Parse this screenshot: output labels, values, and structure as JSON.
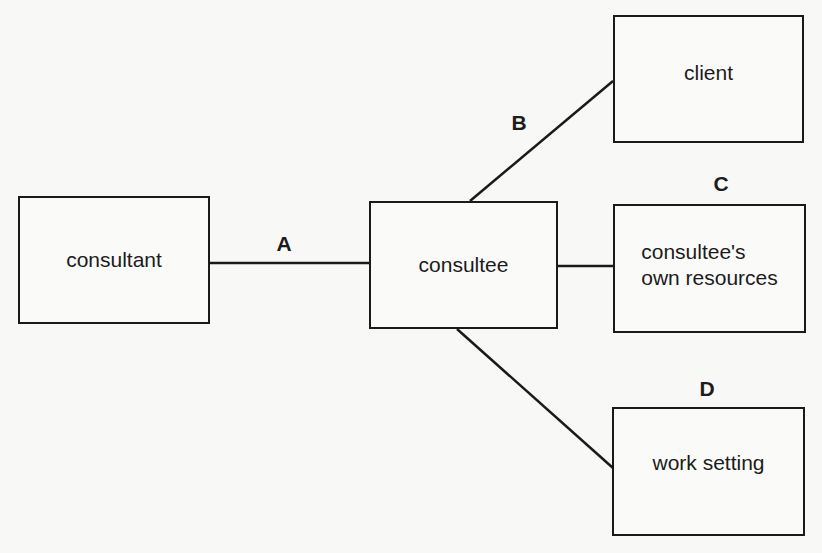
{
  "diagram": {
    "nodes": [
      {
        "id": "consultant",
        "label": "consultant"
      },
      {
        "id": "consultee",
        "label": "consultee"
      },
      {
        "id": "client",
        "label": "client"
      },
      {
        "id": "resources",
        "label_line1": "consultee's",
        "label_line2": "own resources"
      },
      {
        "id": "work_setting",
        "label": "work setting"
      }
    ],
    "edges": [
      {
        "id": "A",
        "label": "A",
        "from": "consultant",
        "to": "consultee"
      },
      {
        "id": "B",
        "label": "B",
        "from": "consultee",
        "to": "client"
      },
      {
        "id": "C",
        "label": "C",
        "from": "consultee",
        "to": "resources"
      },
      {
        "id": "D",
        "label": "D",
        "from": "consultee",
        "to": "work_setting"
      }
    ],
    "colors": {
      "stroke": "#1a1a1a",
      "background": "#f8f8f6"
    }
  }
}
